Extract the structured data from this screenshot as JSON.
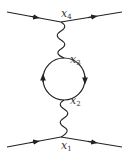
{
  "diagram": {
    "type": "feynman-diagram",
    "line_color": "#222222",
    "vertices": [
      {
        "id": "x4",
        "label": "x",
        "sub": "4",
        "x": 61,
        "y": 22
      },
      {
        "id": "x3",
        "label": "x",
        "sub": "3",
        "x": 64,
        "y": 58
      },
      {
        "id": "x2",
        "label": "x",
        "sub": "2",
        "x": 64,
        "y": 100
      },
      {
        "id": "x1",
        "label": "x",
        "sub": "1",
        "x": 61,
        "y": 137
      }
    ],
    "labels": {
      "x4": {
        "text": "x",
        "sub": "4"
      },
      "x3": {
        "text": "x",
        "sub": "3"
      },
      "x2": {
        "text": "x",
        "sub": "2"
      },
      "x1": {
        "text": "x",
        "sub": "1"
      }
    },
    "fermion_lines": [
      {
        "from": "in-top",
        "to": "x4",
        "arrow": "forward"
      },
      {
        "from": "x4",
        "to": "out-top",
        "arrow": "forward"
      },
      {
        "from": "in-bottom",
        "to": "x1",
        "arrow": "forward"
      },
      {
        "from": "x1",
        "to": "out-bottom",
        "arrow": "forward"
      }
    ],
    "photon_lines": [
      {
        "from": "x4",
        "to": "x3"
      },
      {
        "from": "x2",
        "to": "x1"
      }
    ],
    "fermion_loop": {
      "center_x": 64,
      "center_y": 79,
      "radius": 21,
      "orientation": "clockwise"
    }
  }
}
